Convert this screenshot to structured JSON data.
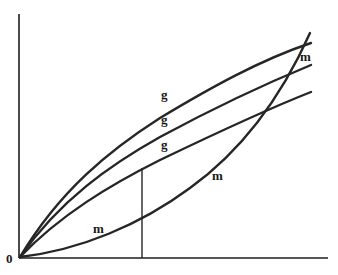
{
  "diagram": {
    "origin_label": "0",
    "curve_labels": {
      "g_top": "g",
      "g_middle": "g",
      "g_lower": "g",
      "m_top": "m",
      "m_middle": "m",
      "m_lower": "m"
    },
    "curves": [
      {
        "name": "g-curve-top",
        "shape": "concave, rising from origin"
      },
      {
        "name": "g-curve-middle",
        "shape": "concave, rising from origin"
      },
      {
        "name": "g-curve-lower",
        "shape": "concave, rising from origin"
      },
      {
        "name": "m-curve",
        "shape": "convex, rising from origin, crosses all g curves near right edge"
      }
    ],
    "vertical_marker": {
      "description": "vertical line from x-axis up to lower g curve"
    },
    "colors": {
      "line": "#262626",
      "background": "#ffffff"
    }
  }
}
